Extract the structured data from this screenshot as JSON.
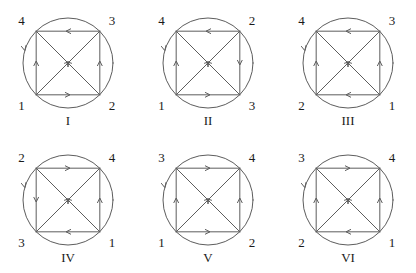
{
  "diagram": {
    "title": "",
    "type": "graph-orientation-figures",
    "canvas": {
      "width": 416,
      "height": 273
    },
    "geometry": {
      "circle_radius": 45,
      "circle_center": [
        68,
        63
      ],
      "square_inscribed": true,
      "arc_marker": "clockwise-arrowhead-on-left-arc",
      "line_color": "#5d5d5d",
      "text_color": "#1a1a1a",
      "background": "#ffffff"
    },
    "figures": [
      {
        "caption": "I",
        "origin": [
          0,
          0
        ],
        "labels": {
          "top_left": "4",
          "top_right": "3",
          "bottom_left": "1",
          "bottom_right": "2"
        },
        "edges": {
          "top": "left",
          "bottom": "right",
          "left": "up",
          "right": "up",
          "diagonal_bl_tr": "up-right",
          "diagonal_br_tl": "up-left"
        },
        "circle_arrow": "down"
      },
      {
        "caption": "II",
        "origin": [
          140,
          0
        ],
        "labels": {
          "top_left": "4",
          "top_right": "2",
          "bottom_left": "1",
          "bottom_right": "3"
        },
        "edges": {
          "top": "left",
          "bottom": "right",
          "left": "up",
          "right": "down",
          "diagonal_bl_tr": "up-right",
          "diagonal_br_tl": "up-left"
        },
        "circle_arrow": "down"
      },
      {
        "caption": "III",
        "origin": [
          280,
          0
        ],
        "labels": {
          "top_left": "4",
          "top_right": "3",
          "bottom_left": "2",
          "bottom_right": "1"
        },
        "edges": {
          "top": "left",
          "bottom": "left",
          "left": "up",
          "right": "up",
          "diagonal_bl_tr": "up-right",
          "diagonal_br_tl": "up-left"
        },
        "circle_arrow": "down"
      },
      {
        "caption": "IV",
        "origin": [
          0,
          137
        ],
        "labels": {
          "top_left": "2",
          "top_right": "4",
          "bottom_left": "3",
          "bottom_right": "1"
        },
        "edges": {
          "top": "right",
          "bottom": "left",
          "left": "down",
          "right": "up",
          "diagonal_bl_tr": "up-right",
          "diagonal_br_tl": "up-left"
        },
        "circle_arrow": "down"
      },
      {
        "caption": "V",
        "origin": [
          140,
          137
        ],
        "labels": {
          "top_left": "3",
          "top_right": "4",
          "bottom_left": "1",
          "bottom_right": "2"
        },
        "edges": {
          "top": "right",
          "bottom": "right",
          "left": "up",
          "right": "up",
          "diagonal_bl_tr": "up-right",
          "diagonal_br_tl": "up-left"
        },
        "circle_arrow": "down"
      },
      {
        "caption": "VI",
        "origin": [
          280,
          137
        ],
        "labels": {
          "top_left": "3",
          "top_right": "4",
          "bottom_left": "2",
          "bottom_right": "1"
        },
        "edges": {
          "top": "right",
          "bottom": "left",
          "left": "up",
          "right": "up",
          "diagonal_bl_tr": "up-right",
          "diagonal_br_tl": "up-left"
        },
        "circle_arrow": "down"
      }
    ]
  }
}
